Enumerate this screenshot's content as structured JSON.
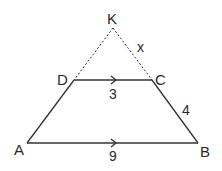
{
  "diagram": {
    "type": "trapezoid-with-extended-sides",
    "points": {
      "K": {
        "label": "K"
      },
      "D": {
        "label": "D"
      },
      "C": {
        "label": "C"
      },
      "A": {
        "label": "A"
      },
      "B": {
        "label": "B"
      }
    },
    "segments": {
      "DC": {
        "length": "3",
        "parallel_marker": true
      },
      "AB": {
        "length": "9",
        "parallel_marker": true
      },
      "CB": {
        "length": "4"
      },
      "KC": {
        "length": "x",
        "style": "dashed"
      },
      "KD": {
        "style": "dashed"
      }
    },
    "colors": {
      "line": "#2a2a2a",
      "background": "#ffffff"
    }
  }
}
